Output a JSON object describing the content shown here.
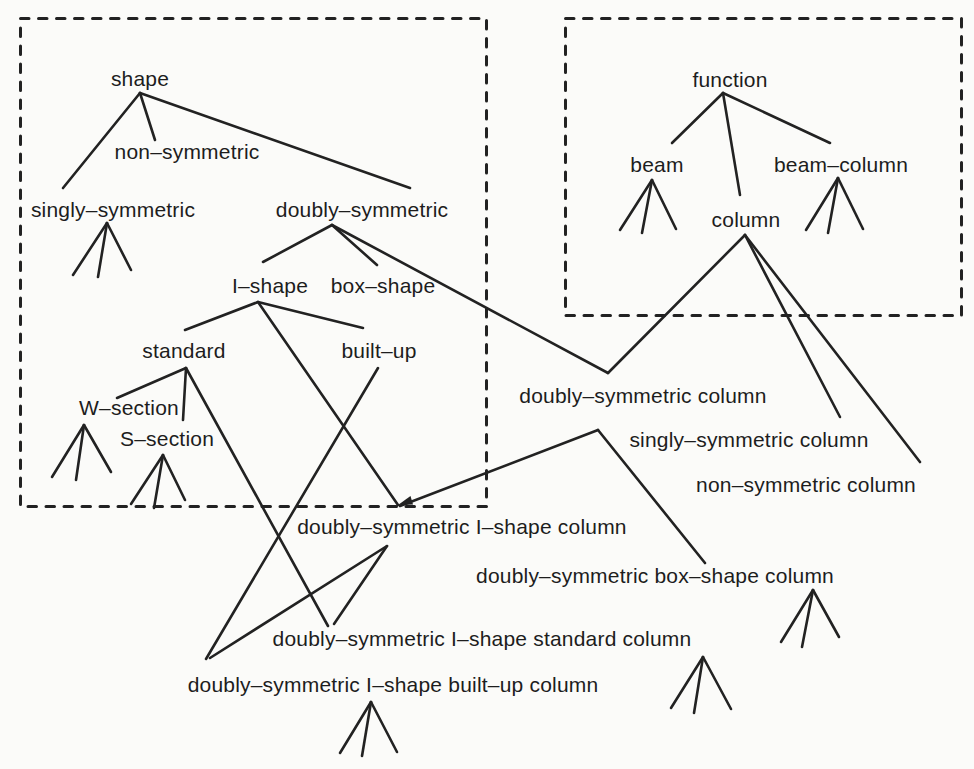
{
  "colors": {
    "ink": "#222222",
    "background": "#fbfbf9"
  },
  "nodes": {
    "shape": "shape",
    "non_symmetric": "non–symmetric",
    "singly_symmetric": "singly–symmetric",
    "doubly_symmetric": "doubly–symmetric",
    "i_shape": "I–shape",
    "box_shape": "box–shape",
    "standard": "standard",
    "built_up": "built–up",
    "w_section": "W–section",
    "s_section": "S–section",
    "function": "function",
    "beam": "beam",
    "column": "column",
    "beam_column": "beam–column",
    "doubly_symmetric_column": "doubly–symmetric column",
    "singly_symmetric_column": "singly–symmetric column",
    "non_symmetric_column": "non–symmetric column",
    "doubly_symmetric_i_shape_column": "doubly–symmetric I–shape column",
    "doubly_symmetric_box_shape_column": "doubly–symmetric box–shape column",
    "doubly_symmetric_i_shape_standard_column": "doubly–symmetric I–shape standard column",
    "doubly_symmetric_i_shape_built_up_column": "doubly–symmetric I–shape built–up column"
  },
  "edges": [
    [
      "shape",
      "singly_symmetric"
    ],
    [
      "shape",
      "non_symmetric"
    ],
    [
      "shape",
      "doubly_symmetric"
    ],
    [
      "doubly_symmetric",
      "i_shape"
    ],
    [
      "doubly_symmetric",
      "box_shape"
    ],
    [
      "doubly_symmetric",
      "doubly_symmetric_column"
    ],
    [
      "i_shape",
      "standard"
    ],
    [
      "i_shape",
      "built_up"
    ],
    [
      "i_shape",
      "doubly_symmetric_i_shape_column"
    ],
    [
      "standard",
      "w_section"
    ],
    [
      "standard",
      "s_section"
    ],
    [
      "standard",
      "doubly_symmetric_i_shape_standard_column"
    ],
    [
      "built_up",
      "doubly_symmetric_i_shape_built_up_column"
    ],
    [
      "function",
      "beam"
    ],
    [
      "function",
      "column"
    ],
    [
      "function",
      "beam_column"
    ],
    [
      "column",
      "doubly_symmetric_column"
    ],
    [
      "column",
      "singly_symmetric_column"
    ],
    [
      "column",
      "non_symmetric_column"
    ],
    [
      "doubly_symmetric_column",
      "doubly_symmetric_i_shape_column"
    ],
    [
      "doubly_symmetric_column",
      "doubly_symmetric_box_shape_column"
    ],
    [
      "doubly_symmetric_i_shape_column",
      "doubly_symmetric_i_shape_standard_column"
    ],
    [
      "doubly_symmetric_i_shape_column",
      "doubly_symmetric_i_shape_built_up_column"
    ]
  ],
  "subtree_markers": [
    "singly_symmetric",
    "w_section",
    "s_section",
    "beam",
    "beam_column",
    "doubly_symmetric_box_shape_column",
    "doubly_symmetric_i_shape_standard_column",
    "doubly_symmetric_i_shape_built_up_column"
  ]
}
